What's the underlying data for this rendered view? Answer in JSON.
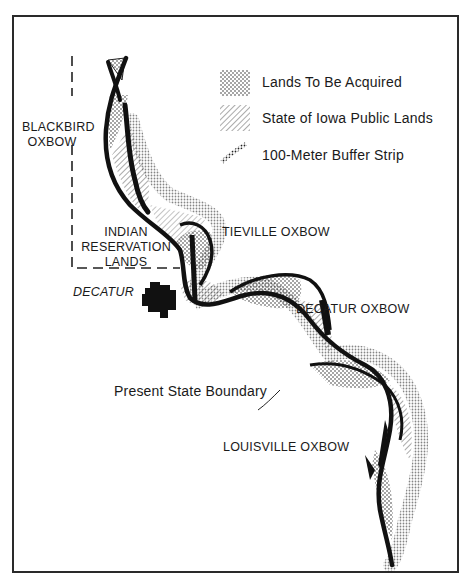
{
  "legend": {
    "items": [
      {
        "label": "Lands To Be Acquired",
        "pattern": "dotted-crosshatch"
      },
      {
        "label": "State of Iowa Public Lands",
        "pattern": "diagonal-hatch"
      },
      {
        "label": "100-Meter Buffer Strip",
        "pattern": "stippled-line"
      }
    ]
  },
  "labels": {
    "blackbird_oxbow": [
      "BLACKBIRD",
      "OXBOW"
    ],
    "indian_reservation": [
      "INDIAN",
      "RESERVATION",
      "LANDS"
    ],
    "tieville_oxbow": "TIEVILLE OXBOW",
    "decatur": "DECATUR",
    "decatur_oxbow": "DECATUR OXBOW",
    "present_state_boundary": "Present State Boundary",
    "louisville_oxbow": "LOUISVILLE OXBOW"
  },
  "colors": {
    "ink": "#111111",
    "background": "#ffffff",
    "hatch": "#555555"
  }
}
